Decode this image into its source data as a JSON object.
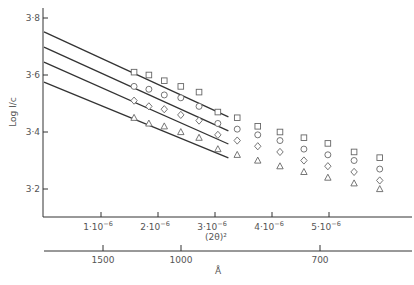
{
  "chart_data": {
    "type": "scatter",
    "title": "",
    "ylabel": "Log I/c",
    "xlabel": "(2θ)²",
    "xlabel_secondary": "Å",
    "ylim": [
      3.1,
      3.84
    ],
    "xlim": [
      0,
      6.3e-06
    ],
    "grid": false,
    "y_ticks": [
      {
        "value": 3.8,
        "label": "3·8"
      },
      {
        "value": 3.6,
        "label": "3·6"
      },
      {
        "value": 3.4,
        "label": "3·4"
      },
      {
        "value": 3.2,
        "label": "3·2"
      }
    ],
    "x_ticks": [
      {
        "value": 1e-06,
        "label": "1·10",
        "exp": "−6"
      },
      {
        "value": 2e-06,
        "label": "2·10",
        "exp": "−6"
      },
      {
        "value": 3e-06,
        "label": "3·10",
        "exp": "−6"
      },
      {
        "value": 4e-06,
        "label": "4·10",
        "exp": "−6"
      },
      {
        "value": 5e-06,
        "label": "5·10",
        "exp": "−6"
      }
    ],
    "secondary_x_ticks": [
      {
        "label": "1500",
        "px": 103
      },
      {
        "label": "1000",
        "px": 181
      },
      {
        "label": "700",
        "px": 320
      }
    ],
    "x": [
      1.58e-06,
      1.84e-06,
      2.11e-06,
      2.4e-06,
      2.72e-06,
      3.05e-06,
      3.39e-06,
      3.75e-06,
      4.14e-06,
      4.56e-06,
      4.98e-06,
      5.44e-06,
      5.89e-06
    ],
    "series": [
      {
        "name": "square",
        "marker": "square",
        "values": [
          3.61,
          3.6,
          3.58,
          3.56,
          3.54,
          3.47,
          3.45,
          3.42,
          3.4,
          3.38,
          3.36,
          3.33,
          3.31
        ]
      },
      {
        "name": "circle",
        "marker": "circle",
        "values": [
          3.56,
          3.55,
          3.53,
          3.52,
          3.49,
          3.43,
          3.41,
          3.39,
          3.37,
          3.34,
          3.32,
          3.3,
          3.27
        ]
      },
      {
        "name": "diamond",
        "marker": "diamond",
        "values": [
          3.51,
          3.49,
          3.48,
          3.46,
          3.44,
          3.39,
          3.37,
          3.35,
          3.33,
          3.3,
          3.28,
          3.26,
          3.23
        ]
      },
      {
        "name": "triangle",
        "marker": "triangle",
        "values": [
          3.45,
          3.43,
          3.42,
          3.4,
          3.38,
          3.34,
          3.32,
          3.3,
          3.28,
          3.26,
          3.24,
          3.22,
          3.2
        ]
      }
    ],
    "fit_lines": [
      {
        "series": "square",
        "x0": 0,
        "y0": 3.751,
        "x1": 3.2e-06,
        "y1": 3.453
      },
      {
        "series": "circle",
        "x0": 0,
        "y0": 3.698,
        "x1": 3.2e-06,
        "y1": 3.404
      },
      {
        "series": "diamond",
        "x0": 0,
        "y0": 3.645,
        "x1": 3.2e-06,
        "y1": 3.358
      },
      {
        "series": "triangle",
        "x0": 0,
        "y0": 3.575,
        "x1": 3.2e-06,
        "y1": 3.309
      }
    ]
  },
  "colors": {
    "ink": "#333333",
    "text": "#555555",
    "marker": "#666666"
  }
}
